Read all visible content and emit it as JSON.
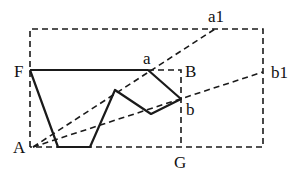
{
  "labels": {
    "F": "F",
    "a": "a",
    "B": "B",
    "a1": "a1",
    "b1": "b1",
    "b": "b",
    "A": "A",
    "G": "G"
  },
  "points": {
    "F": [
      30,
      70
    ],
    "a": [
      148,
      70
    ],
    "b": [
      181,
      99
    ],
    "A": [
      33,
      147
    ],
    "a1": [
      215,
      29
    ],
    "b1": [
      263,
      72
    ],
    "G": [
      181,
      147
    ],
    "P1": [
      58,
      147
    ],
    "P2": [
      90,
      147
    ],
    "P3": [
      115,
      90
    ],
    "P4": [
      151,
      114
    ]
  },
  "outer_box": {
    "left": 30,
    "top": 29,
    "right": 263,
    "bottom": 147
  },
  "inner_box": {
    "left": 30,
    "top": 70,
    "right": 181,
    "bottom": 147
  },
  "colors": {
    "stroke": "#1a1a1a",
    "background": "#ffffff"
  }
}
